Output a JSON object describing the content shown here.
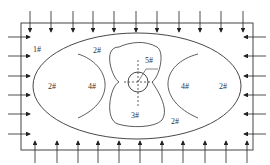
{
  "diagram": {
    "zones": [
      {
        "id": "zone-1",
        "label": "1#",
        "x": 33,
        "y": 52
      },
      {
        "id": "zone-2-top",
        "label": "2#",
        "x": 93,
        "y": 53
      },
      {
        "id": "zone-2-left",
        "label": "2#",
        "x": 48,
        "y": 89
      },
      {
        "id": "zone-4-left",
        "label": "4#",
        "x": 88,
        "y": 89
      },
      {
        "id": "zone-5",
        "label": "5#",
        "x": 145,
        "y": 63
      },
      {
        "id": "zone-4-right",
        "label": "4#",
        "x": 181,
        "y": 89
      },
      {
        "id": "zone-2-right",
        "label": "2#",
        "x": 219,
        "y": 89
      },
      {
        "id": "zone-3",
        "label": "3#",
        "x": 131,
        "y": 118
      },
      {
        "id": "zone-2-bottom",
        "label": "2#",
        "x": 171,
        "y": 124
      }
    ],
    "load_arrows": {
      "top_x": [
        30,
        51,
        73,
        93,
        114,
        136,
        157,
        179,
        200,
        221,
        243
      ],
      "bottom_x": [
        35,
        57,
        78,
        98,
        119,
        140,
        162,
        183,
        205,
        226,
        247
      ],
      "left_y": [
        37,
        56,
        76,
        95,
        114,
        134
      ],
      "right_y": [
        37,
        56,
        76,
        95,
        114,
        134
      ]
    }
  }
}
